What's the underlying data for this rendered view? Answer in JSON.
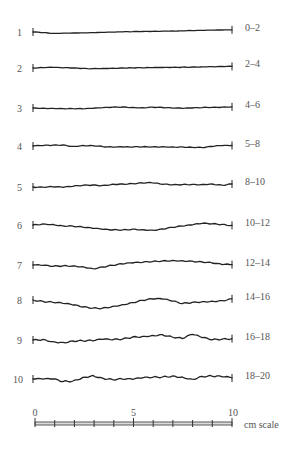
{
  "profiles": [
    {
      "number": "1",
      "jrc_range": "0–2",
      "shape": [
        0,
        0.6,
        1.4,
        1.2,
        1.0,
        0.8,
        0.6,
        0.4,
        0.2,
        -0.1,
        -0.3,
        -0.5,
        -0.7,
        -0.9,
        -1.0,
        -1.2,
        -1.4,
        -1.6,
        -1.8,
        -2.0,
        -2.2
      ]
    },
    {
      "number": "2",
      "jrc_range": "2–4",
      "shape": [
        0,
        -0.4,
        -0.6,
        -0.2,
        0,
        0.4,
        0.6,
        0.4,
        0.2,
        0,
        -0.1,
        -0.2,
        -0.3,
        -0.5,
        -0.6,
        -0.8,
        -1.0,
        -1.2,
        -1.4,
        -1.5,
        -1.6
      ]
    },
    {
      "number": "3",
      "jrc_range": "4–6",
      "shape": [
        0,
        0.2,
        0.4,
        0.6,
        0.7,
        0.8,
        0.4,
        -0.3,
        -0.8,
        -1.0,
        -0.6,
        -0.3,
        -0.9,
        -0.5,
        0.1,
        0.3,
        0.0,
        -0.4,
        -0.7,
        -0.9,
        -1.2
      ]
    },
    {
      "number": "4",
      "jrc_range": "5–8",
      "shape": [
        0,
        -0.4,
        -0.8,
        -1.0,
        0.4,
        -0.6,
        -0.4,
        0.6,
        1.2,
        1.0,
        1.2,
        0.8,
        0.9,
        0.7,
        0.9,
        0.9,
        1.3,
        1.6,
        0.5,
        -0.3,
        -0.5
      ]
    },
    {
      "number": "5",
      "jrc_range": "8–10",
      "shape": [
        0,
        0.2,
        -0.2,
        0.4,
        -0.6,
        -1.6,
        -2.0,
        -1.6,
        -2.8,
        -3.0,
        -3.3,
        -4.0,
        -4.2,
        -2.6,
        -2.2,
        -2.4,
        -2.6,
        -2.6,
        -3.0,
        -1.8,
        -3.0
      ]
    },
    {
      "number": "6",
      "jrc_range": "10–12",
      "shape": [
        0,
        -1.2,
        -0.6,
        0.8,
        1.2,
        2.2,
        3.4,
        4.4,
        5.0,
        4.9,
        4.2,
        4.6,
        5.2,
        4.0,
        2.4,
        1.2,
        0.0,
        -1.6,
        -1.2,
        -0.6,
        0.4
      ]
    },
    {
      "number": "7",
      "jrc_range": "12–14",
      "shape": [
        0,
        0.4,
        1.4,
        0.8,
        0.8,
        1.6,
        3.6,
        2.0,
        0.4,
        -1.0,
        -2.0,
        -2.6,
        -3.4,
        -4.2,
        -4.6,
        -4.4,
        -3.8,
        -3.0,
        -2.0,
        -0.4,
        -0.4
      ]
    },
    {
      "number": "8",
      "jrc_range": "14–16",
      "shape": [
        0,
        1.4,
        2.4,
        3.4,
        5.0,
        7.0,
        8.2,
        8.0,
        6.4,
        4.6,
        2.6,
        0.4,
        -1.0,
        -1.0,
        1.2,
        3.6,
        2.4,
        1.6,
        1.2,
        0.6,
        -1.2
      ]
    },
    {
      "number": "9",
      "jrc_range": "16–18",
      "shape": [
        0,
        -0.6,
        1.6,
        2.4,
        1.0,
        0.8,
        0.8,
        -0.6,
        -0.2,
        -0.8,
        -3.0,
        -3.6,
        -4.6,
        -5.4,
        -3.0,
        -1.4,
        -5.6,
        -2.4,
        -0.2,
        -0.8,
        -1.4
      ]
    },
    {
      "number": "10",
      "jrc_range": "18–20",
      "shape": [
        0,
        0.2,
        0.0,
        2.6,
        2.0,
        -1.6,
        -3.6,
        -0.8,
        0.6,
        0.2,
        0.4,
        -1.0,
        -1.6,
        -2.0,
        -3.0,
        -2.0,
        0.2,
        -2.6,
        -2.8,
        -2.2,
        -1.0
      ]
    }
  ],
  "scale": {
    "tick_labels": [
      "0",
      "5",
      "10"
    ],
    "unit_label": "cm scale",
    "min": 0,
    "max": 10,
    "minor_divisions": 10
  }
}
